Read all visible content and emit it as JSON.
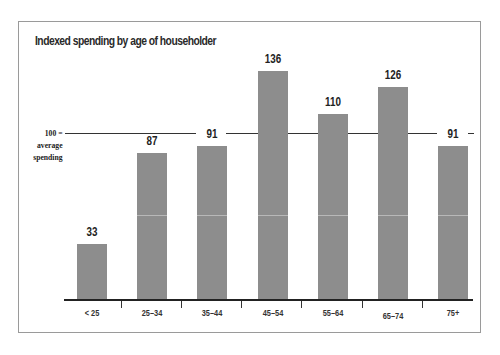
{
  "chart_data": {
    "type": "bar",
    "title": "Indexed spending by age of householder",
    "xlabel": "",
    "ylabel": "",
    "categories": [
      "< 25",
      "25–34",
      "35–44",
      "45–54",
      "55–64",
      "65–74",
      "75+"
    ],
    "values": [
      33,
      87,
      91,
      136,
      110,
      126,
      91
    ],
    "reference_line": {
      "value": 100,
      "label": [
        "100 =",
        "average",
        "spending"
      ]
    },
    "ylim": [
      0,
      140
    ],
    "grid": false,
    "legend": null,
    "colors": {
      "bar": "#8d8d8d",
      "axis": "#222222",
      "reference": "#333333"
    }
  },
  "labels": {
    "title": "Indexed spending by age of householder",
    "ref_line1": "100 =",
    "ref_line2": "average",
    "ref_line3": "spending",
    "values": [
      "33",
      "87",
      "91",
      "136",
      "110",
      "126",
      "91"
    ],
    "categories": [
      "< 25",
      "25–34",
      "35–44",
      "45–54",
      "55–64",
      "65–74",
      "75+"
    ]
  }
}
